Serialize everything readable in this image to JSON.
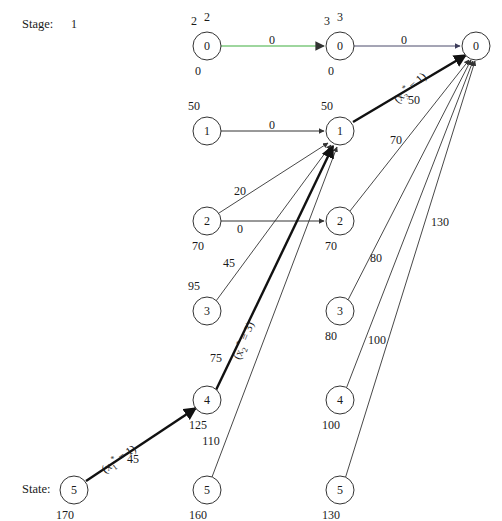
{
  "figure": {
    "type": "network-diagram",
    "stage_axis_label": "Stage:",
    "state_axis_label": "State:",
    "stage_numbers": [
      "1",
      "2",
      "3"
    ],
    "accent_edge_color": "#7ec87e",
    "line_color": "#333333"
  },
  "columns": {
    "col1_x": 207,
    "col2_x": 340,
    "col3_x": 476
  },
  "nodes": [
    {
      "id": "n1-0",
      "label": "0",
      "col": 1,
      "x": 207,
      "y": 46,
      "above": "2",
      "below": "0"
    },
    {
      "id": "n1-1",
      "label": "1",
      "col": 1,
      "x": 207,
      "y": 131,
      "above": "50",
      "below": ""
    },
    {
      "id": "n1-2",
      "label": "2",
      "col": 1,
      "x": 207,
      "y": 221,
      "above": "",
      "below": "70"
    },
    {
      "id": "n1-3",
      "label": "3",
      "col": 1,
      "x": 207,
      "y": 311,
      "above": "95",
      "below": ""
    },
    {
      "id": "n1-4",
      "label": "4",
      "col": 1,
      "x": 207,
      "y": 400,
      "above": "",
      "below": "125"
    },
    {
      "id": "n1-5",
      "label": "5",
      "col": 1,
      "x": 74,
      "y": 490,
      "above": "",
      "below": "170"
    },
    {
      "id": "n1-5b",
      "label": "5",
      "col": 1,
      "x": 207,
      "y": 490,
      "above": "",
      "below": "160"
    },
    {
      "id": "n2-0",
      "label": "0",
      "col": 2,
      "x": 340,
      "y": 46,
      "above": "3",
      "below": "0"
    },
    {
      "id": "n2-1",
      "label": "1",
      "col": 2,
      "x": 340,
      "y": 131,
      "above": "50",
      "below": ""
    },
    {
      "id": "n2-2",
      "label": "2",
      "col": 2,
      "x": 340,
      "y": 221,
      "above": "",
      "below": "70"
    },
    {
      "id": "n2-3",
      "label": "3",
      "col": 2,
      "x": 340,
      "y": 311,
      "above": "",
      "below": "80"
    },
    {
      "id": "n2-4",
      "label": "4",
      "col": 2,
      "x": 340,
      "y": 400,
      "above": "",
      "below": "100"
    },
    {
      "id": "n2-5",
      "label": "5",
      "col": 2,
      "x": 340,
      "y": 490,
      "above": "",
      "below": "130"
    },
    {
      "id": "n3-0",
      "label": "0",
      "col": 3,
      "x": 476,
      "y": 46,
      "above": "",
      "below": ""
    }
  ],
  "edge_labels": [
    {
      "id": "el-top-1",
      "text": "0",
      "x": 272,
      "y": 40
    },
    {
      "id": "el-top-2",
      "text": "0",
      "x": 404,
      "y": 40
    },
    {
      "id": "el-mid-1",
      "text": "0",
      "x": 272,
      "y": 125
    },
    {
      "id": "el-50",
      "text": "50",
      "x": 414,
      "y": 100
    },
    {
      "id": "el-70",
      "text": "70",
      "x": 396,
      "y": 140
    },
    {
      "id": "el-20",
      "text": "20",
      "x": 240,
      "y": 191
    },
    {
      "id": "el-0b",
      "text": "0",
      "x": 240,
      "y": 229
    },
    {
      "id": "el-80",
      "text": "80",
      "x": 376,
      "y": 258
    },
    {
      "id": "el-45",
      "text": "45",
      "x": 229,
      "y": 263
    },
    {
      "id": "el-100",
      "text": "100",
      "x": 377,
      "y": 340
    },
    {
      "id": "el-130",
      "text": "130",
      "x": 440,
      "y": 222
    },
    {
      "id": "el-75",
      "text": "75",
      "x": 216,
      "y": 358
    },
    {
      "id": "el-110",
      "text": "110",
      "x": 211,
      "y": 441
    },
    {
      "id": "el-45b",
      "text": "45",
      "x": 133,
      "y": 459
    }
  ],
  "policy_labels": [
    {
      "id": "pol-3",
      "prefix": "(x",
      "sub": "3",
      "sup": "*",
      "suffix": " = 1)",
      "x": 390,
      "y": 95,
      "rotate": -42
    },
    {
      "id": "pol-2",
      "prefix": "(x",
      "sub": "2",
      "sup": "*",
      "suffix": " = 3)",
      "x": 229,
      "y": 356,
      "rotate": -69
    },
    {
      "id": "pol-1",
      "prefix": "(x",
      "sub": "1",
      "sup": "*",
      "suffix": " = 1)",
      "x": 98,
      "y": 464,
      "rotate": -36
    }
  ],
  "edges": [
    {
      "id": "e-g1",
      "from": "n1-0",
      "to": "n2-0",
      "label": "0",
      "highlight": true,
      "thick": false,
      "color": "#7ec87e"
    },
    {
      "id": "e-g2",
      "from": "n2-0",
      "to": "n3-0",
      "label": "0",
      "highlight": false,
      "thick": false,
      "color": "#4a4a6a"
    },
    {
      "id": "e-a",
      "from": "n1-1",
      "to": "n2-1",
      "label": "0",
      "highlight": false,
      "thick": false,
      "color": "#333333"
    },
    {
      "id": "e-b",
      "from": "n1-2",
      "to": "n2-2",
      "label": "0",
      "highlight": false,
      "thick": false,
      "color": "#333333"
    },
    {
      "id": "e-c",
      "from": "n1-2",
      "to": "n2-1",
      "label": "20",
      "highlight": false,
      "thick": false,
      "color": "#333333"
    },
    {
      "id": "e-d",
      "from": "n1-3",
      "to": "n2-1",
      "label": "45",
      "highlight": false,
      "thick": false,
      "color": "#333333"
    },
    {
      "id": "e-e",
      "from": "n1-4",
      "to": "n2-1",
      "label": "75",
      "highlight": false,
      "thick": true,
      "color": "#111111"
    },
    {
      "id": "e-f",
      "from": "n1-5b",
      "to": "n2-1",
      "label": "110",
      "highlight": false,
      "thick": false,
      "color": "#333333"
    },
    {
      "id": "e-h",
      "from": "n1-5",
      "to": "n1-4",
      "label": "45",
      "highlight": false,
      "thick": true,
      "color": "#111111"
    },
    {
      "id": "e-i",
      "from": "n2-1",
      "to": "n3-0",
      "label": "50",
      "highlight": false,
      "thick": true,
      "color": "#111111"
    },
    {
      "id": "e-j",
      "from": "n2-2",
      "to": "n3-0",
      "label": "70",
      "highlight": false,
      "thick": false,
      "color": "#333333"
    },
    {
      "id": "e-k",
      "from": "n2-3",
      "to": "n3-0",
      "label": "80",
      "highlight": false,
      "thick": false,
      "color": "#333333"
    },
    {
      "id": "e-l",
      "from": "n2-4",
      "to": "n3-0",
      "label": "100",
      "highlight": false,
      "thick": false,
      "color": "#333333"
    },
    {
      "id": "e-m",
      "from": "n2-5",
      "to": "n3-0",
      "label": "130",
      "highlight": false,
      "thick": false,
      "color": "#333333"
    }
  ]
}
